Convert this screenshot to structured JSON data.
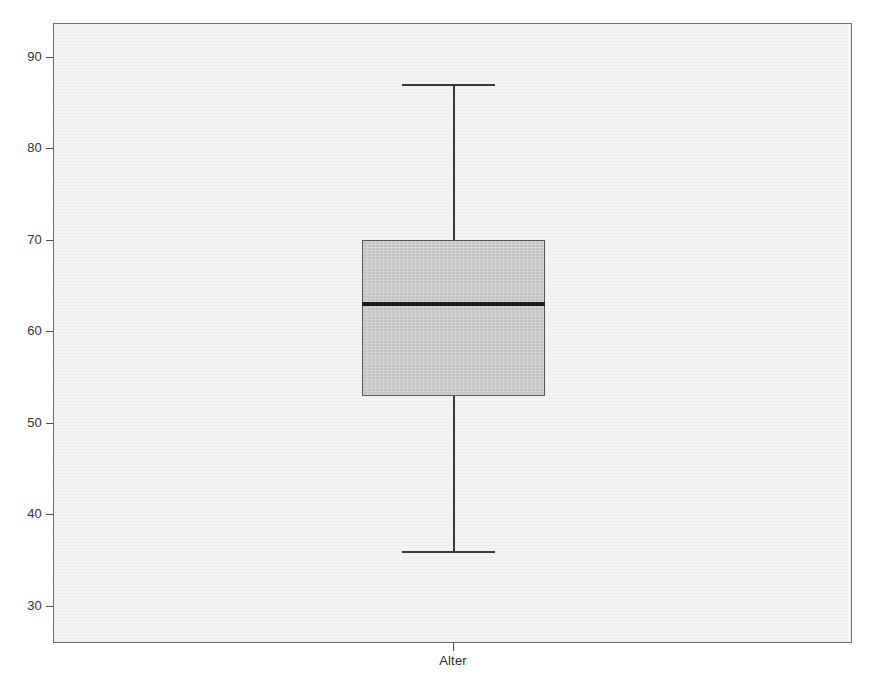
{
  "chart_data": {
    "type": "box",
    "title": "",
    "xlabel": "",
    "ylabel": "",
    "categories": [
      "Alter"
    ],
    "grid": false,
    "legend": null,
    "ylim": [
      27,
      94
    ],
    "y_ticks": [
      90,
      80,
      70,
      60,
      50,
      40,
      30
    ],
    "y_tick_labels": [
      "90",
      "80",
      "70",
      "60",
      "50",
      "40",
      "30"
    ],
    "boxes": [
      {
        "label": "Alter",
        "min": 36,
        "q1": 53,
        "median": 63,
        "q3": 70,
        "max": 87,
        "iqr": 17,
        "outliers": []
      }
    ]
  },
  "axes": {
    "y": {
      "ticks": [
        {
          "value": 90,
          "label": "90"
        },
        {
          "value": 80,
          "label": "80"
        },
        {
          "value": 70,
          "label": "70"
        },
        {
          "value": 60,
          "label": "60"
        },
        {
          "value": 50,
          "label": "50"
        },
        {
          "value": 40,
          "label": "40"
        },
        {
          "value": 30,
          "label": "30"
        }
      ]
    },
    "x": {
      "ticks": [
        {
          "label": "Alter"
        }
      ]
    }
  },
  "colors": {
    "panel_background": "#f4f4f4",
    "panel_border": "#6e6e6e",
    "box_fill": "#c3c3c3",
    "box_border": "#555555",
    "median": "#1a1a1a",
    "whisker": "#3a3a3a",
    "tick_label": "#333333",
    "page_background": "#ffffff"
  }
}
